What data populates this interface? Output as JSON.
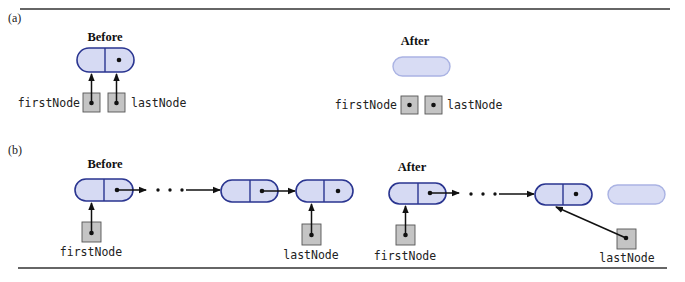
{
  "figure": {
    "panels": [
      {
        "id": "a",
        "label": "(a)",
        "before": {
          "heading": "Before",
          "nodes": 1,
          "first_node_label": "firstNode",
          "last_node_label": "lastNode"
        },
        "after": {
          "heading": "After",
          "ghost_nodes": 1,
          "first_node_label": "firstNode",
          "last_node_label": "lastNode"
        }
      },
      {
        "id": "b",
        "label": "(b)",
        "before": {
          "heading": "Before",
          "nodes": 3,
          "ellipsis": "· · ·",
          "first_node_label": "firstNode",
          "last_node_label": "lastNode"
        },
        "after": {
          "heading": "After",
          "nodes": 2,
          "ghost_nodes": 1,
          "ellipsis": "· · ·",
          "first_node_label": "firstNode",
          "last_node_label": "lastNode"
        }
      }
    ],
    "colors": {
      "node_fill": "#d6daf3",
      "node_stroke": "#2a3590",
      "ghost_fill": "#d8dcf4",
      "ghost_stroke": "#aab3e3",
      "ref_box_fill": "#c4c4c4"
    }
  }
}
